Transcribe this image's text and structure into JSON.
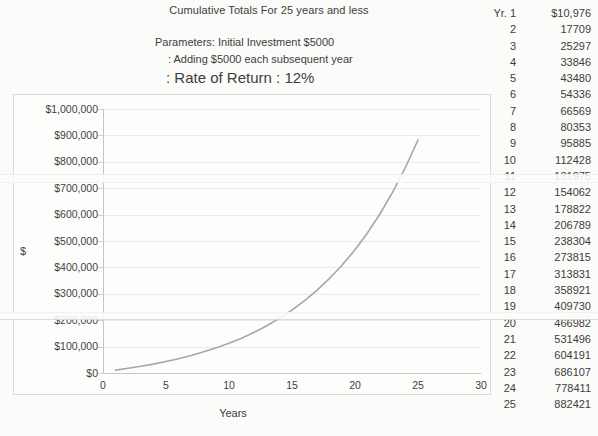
{
  "title": "Cumulative Totals For 25 years and less",
  "parameters": {
    "line1": "Parameters: Initial Investment $5000",
    "line2": ": Adding $5000 each subsequent year",
    "line3": ": Rate of Return : 12%"
  },
  "side_table": {
    "rows": [
      {
        "year": "Yr. 1",
        "value": "$10,976"
      },
      {
        "year": "2",
        "value": "17709"
      },
      {
        "year": "3",
        "value": "25297"
      },
      {
        "year": "4",
        "value": "33846"
      },
      {
        "year": "5",
        "value": "43480"
      },
      {
        "year": "6",
        "value": "54336"
      },
      {
        "year": "7",
        "value": "66569"
      },
      {
        "year": "8",
        "value": "80353"
      },
      {
        "year": "9",
        "value": "95885"
      },
      {
        "year": "10",
        "value": "112428"
      },
      {
        "year": "11",
        "value": "131975"
      },
      {
        "year": "12",
        "value": "154062"
      },
      {
        "year": "13",
        "value": "178822"
      },
      {
        "year": "14",
        "value": "206789"
      },
      {
        "year": "15",
        "value": "238304"
      },
      {
        "year": "16",
        "value": "273815"
      },
      {
        "year": "17",
        "value": "313831"
      },
      {
        "year": "18",
        "value": "358921"
      },
      {
        "year": "19",
        "value": "409730"
      },
      {
        "year": "20",
        "value": "466982"
      },
      {
        "year": "21",
        "value": "531496"
      },
      {
        "year": "22",
        "value": "604191"
      },
      {
        "year": "23",
        "value": "686107"
      },
      {
        "year": "24",
        "value": "778411"
      },
      {
        "year": "25",
        "value": "882421"
      }
    ]
  },
  "chart_data": {
    "type": "line",
    "title": "Cumulative Totals For 25 years and less",
    "xlabel": "Years",
    "ylabel": "$",
    "x": [
      1,
      2,
      3,
      4,
      5,
      6,
      7,
      8,
      9,
      10,
      11,
      12,
      13,
      14,
      15,
      16,
      17,
      18,
      19,
      20,
      21,
      22,
      23,
      24,
      25
    ],
    "series": [
      {
        "name": "Cumulative total",
        "values": [
          10976,
          17709,
          25297,
          33846,
          43480,
          54336,
          66569,
          80353,
          95885,
          112428,
          131975,
          154062,
          178822,
          206789,
          238304,
          273815,
          313831,
          358921,
          409730,
          466982,
          531496,
          604191,
          686107,
          778411,
          882421
        ]
      }
    ],
    "xlim": [
      0,
      30
    ],
    "ylim": [
      0,
      1000000
    ],
    "x_ticks": [
      0,
      5,
      10,
      15,
      20,
      25,
      30
    ],
    "y_tick_labels": [
      "$0",
      "$100,000",
      "$200,000",
      "$300,000",
      "$400,000",
      "$500,000",
      "$600,000",
      "$700,000",
      "$800,000",
      "$900,000",
      "$1,000,000"
    ],
    "grid": true,
    "legend": false,
    "line_color": "#a6a6a6"
  },
  "colors": {
    "curve": "#a6a6a6",
    "gridline": "#eaeaea",
    "axis_line": "#c6c6c6",
    "frame_border": "#dadada",
    "text": "#3d3d3d",
    "background": "#fbfbf9"
  }
}
